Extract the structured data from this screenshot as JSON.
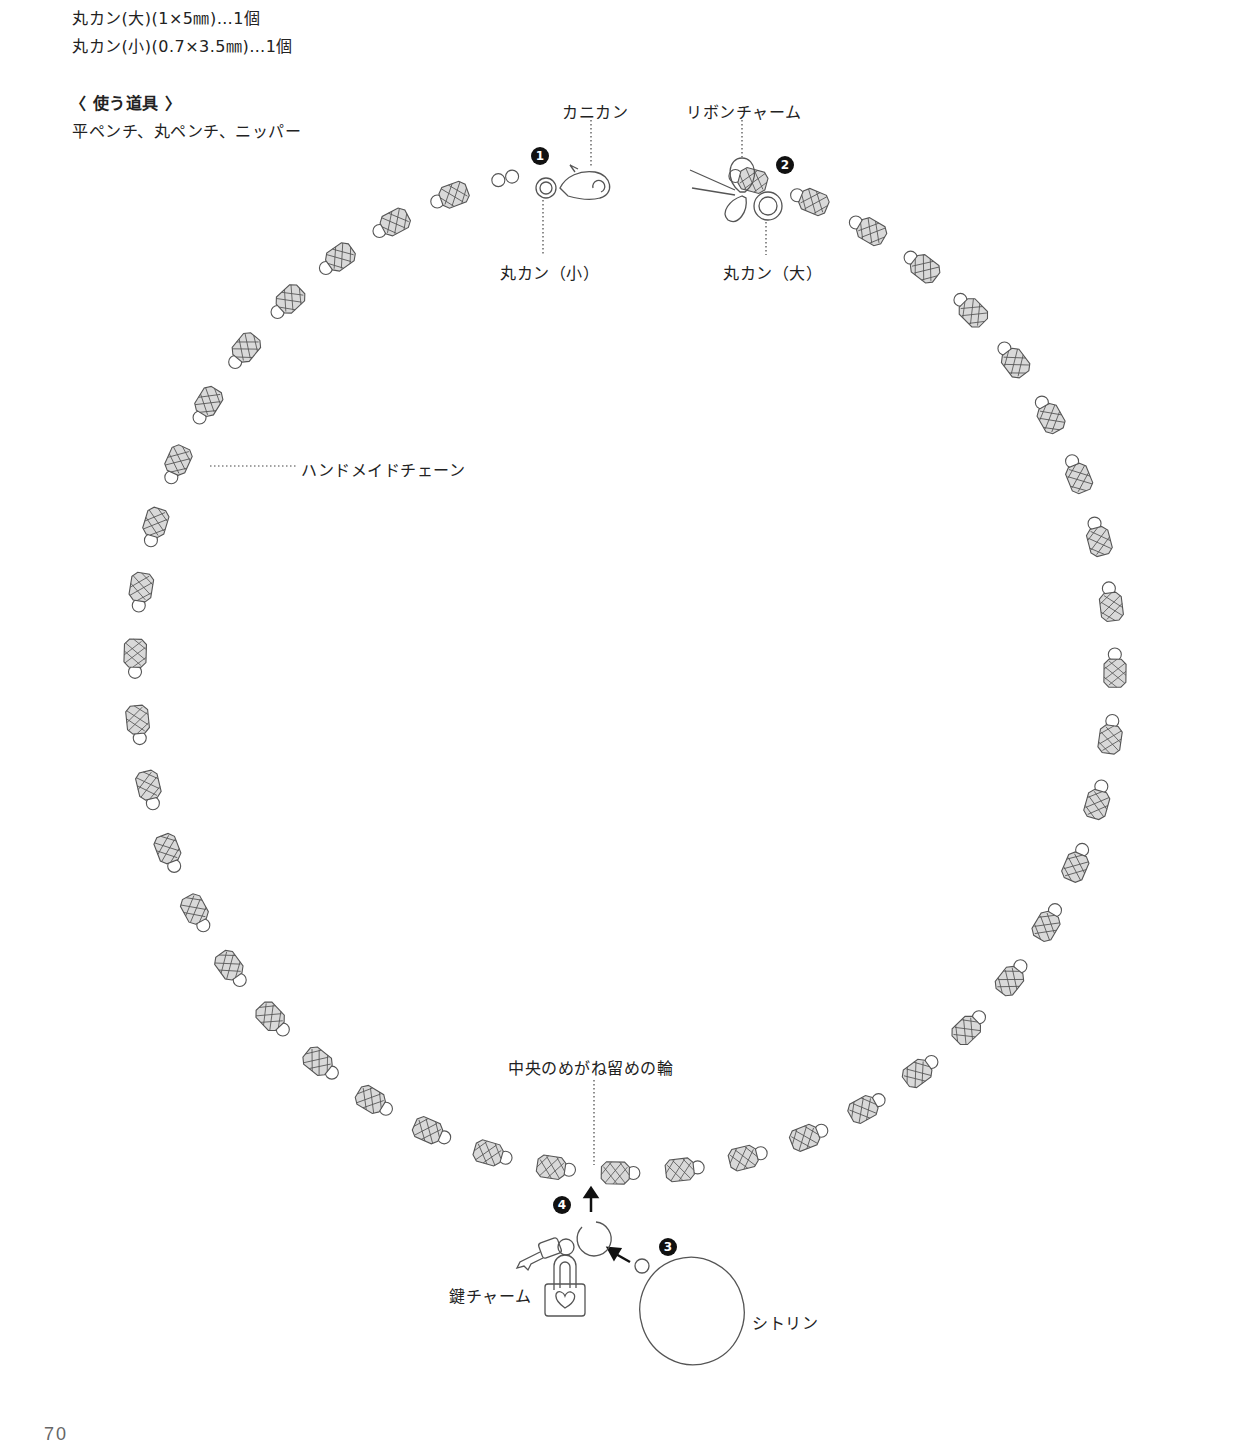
{
  "materials": [
    "丸カン(大)(1×5㎜)…1個",
    "丸カン(小)(0.7×3.5㎜)…1個"
  ],
  "tools": {
    "heading": "〈 使う道具 〉",
    "list": "平ペンチ、丸ペンチ、ニッパー"
  },
  "labels": {
    "kanikan": "カニカン",
    "ribbon_charm": "リボンチャーム",
    "marukan_small": "丸カン（小）",
    "marukan_large": "丸カン（大）",
    "handmade_chain": "ハンドメイドチェーン",
    "center_ring": "中央のめがね留めの輪",
    "key_charm": "鍵チャーム",
    "citrine": "シトリン"
  },
  "steps": [
    "1",
    "2",
    "3",
    "4"
  ],
  "page_number": "70",
  "necklace": {
    "center_x": 625,
    "center_y": 668,
    "radius_x": 490,
    "radius_y": 505,
    "bead_count": 44,
    "gap_start_deg": -104,
    "gap_end_deg": -76,
    "bead_fill": "#d9d9d9",
    "line_color": "#555555"
  }
}
